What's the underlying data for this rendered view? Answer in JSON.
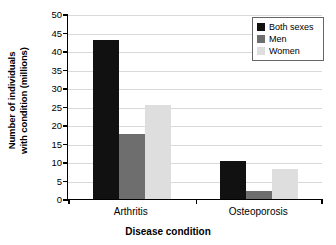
{
  "chart_data": {
    "type": "bar",
    "title": "",
    "xlabel": "Disease condition",
    "ylabel_line1": "Number of individuals",
    "ylabel_line2": "with condition (millions)",
    "categories": [
      "Arthritis",
      "Osteoporosis"
    ],
    "series": [
      {
        "name": "Both sexes",
        "color": "#111111",
        "values": [
          43.0,
          10.3
        ]
      },
      {
        "name": "Men",
        "color": "#6e6e6e",
        "values": [
          17.7,
          2.3
        ]
      },
      {
        "name": "Women",
        "color": "#dedede",
        "values": [
          25.4,
          8.2
        ]
      }
    ],
    "ylim": [
      0,
      50
    ],
    "yticks": [
      0,
      5,
      10,
      15,
      20,
      25,
      30,
      35,
      40,
      45,
      50
    ],
    "ytick_labels": [
      "0",
      "5",
      "10",
      "15",
      "20",
      "25",
      "30",
      "35",
      "40",
      "45",
      "50"
    ],
    "grid": true,
    "legend_position": "top-right"
  }
}
